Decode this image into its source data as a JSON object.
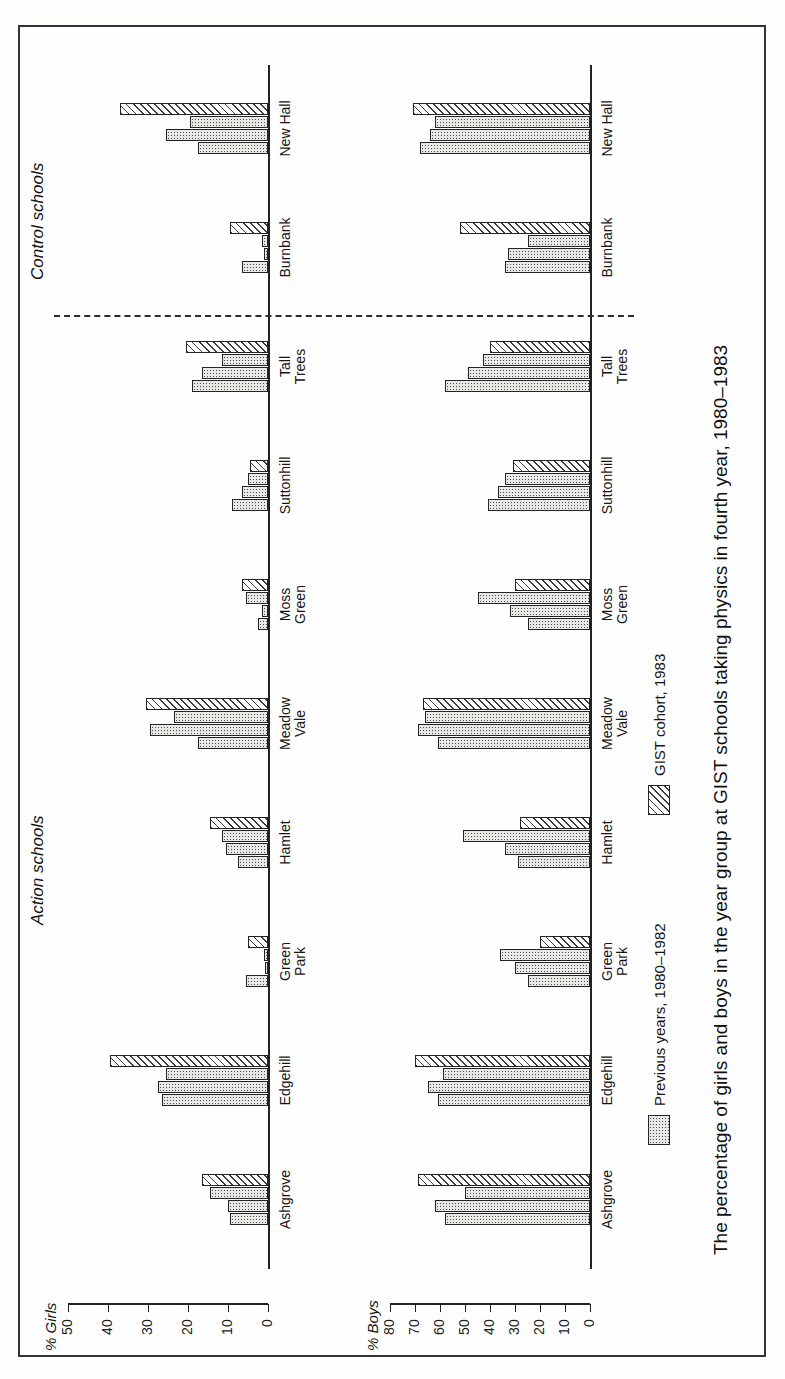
{
  "figure": {
    "caption": "The percentage of girls and boys in the year group at GIST schools taking physics in fourth year, 1980–1983",
    "section_headers": {
      "action": "Action schools",
      "control": "Control schools"
    },
    "legend": [
      {
        "label": "Previous years, 1980–1982",
        "pattern": "dotted"
      },
      {
        "label": "GIST cohort, 1983",
        "pattern": "hatched"
      }
    ]
  },
  "chart_data": [
    {
      "type": "bar",
      "orientation": "horizontal",
      "title": "",
      "ylabel": "% Girls",
      "xlabel": "",
      "ylim": [
        0,
        50
      ],
      "ticks": [
        0,
        10,
        20,
        30,
        40,
        50
      ],
      "grid": false,
      "legend_position": "below",
      "categories": [
        "Ashgrove",
        "Edgehill",
        "Green\nPark",
        "Hamlet",
        "Meadow\nVale",
        "Moss\nGreen",
        "Suttonhill",
        "Tall\nTrees",
        "Burnbank",
        "New Hall"
      ],
      "series": [
        {
          "name": "1980",
          "pattern": "dotted",
          "values": [
            9.5,
            26.5,
            5.5,
            7.5,
            17.5,
            2.5,
            9.0,
            19.0,
            6.5,
            17.5
          ]
        },
        {
          "name": "1981",
          "pattern": "dotted",
          "values": [
            10.0,
            27.5,
            0.8,
            10.5,
            29.5,
            1.5,
            6.5,
            16.5,
            1.0,
            25.5
          ]
        },
        {
          "name": "1982",
          "pattern": "dotted",
          "values": [
            14.5,
            25.5,
            1.0,
            11.5,
            23.5,
            5.5,
            5.0,
            11.5,
            1.5,
            19.5
          ]
        },
        {
          "name": "GIST cohort, 1983",
          "pattern": "hatched",
          "values": [
            16.5,
            39.5,
            5.0,
            14.5,
            30.5,
            6.5,
            4.5,
            20.5,
            9.5,
            37.0
          ]
        }
      ]
    },
    {
      "type": "bar",
      "orientation": "horizontal",
      "title": "",
      "ylabel": "% Boys",
      "xlabel": "",
      "ylim": [
        0,
        80
      ],
      "ticks": [
        0,
        10,
        20,
        30,
        40,
        50,
        60,
        70,
        80
      ],
      "grid": false,
      "legend_position": "below",
      "categories": [
        "Ashgrove",
        "Edgehill",
        "Green\nPark",
        "Hamlet",
        "Meadow\nVale",
        "Moss\nGreen",
        "Suttonhill",
        "Tall\nTrees",
        "Burnbank",
        "New Hall"
      ],
      "series": [
        {
          "name": "1980",
          "pattern": "dotted",
          "values": [
            58.0,
            61.0,
            25.0,
            29.0,
            61.0,
            25.0,
            41.0,
            58.0,
            34.0,
            68.0
          ]
        },
        {
          "name": "1981",
          "pattern": "dotted",
          "values": [
            62.0,
            65.0,
            30.0,
            34.0,
            69.0,
            32.0,
            37.0,
            49.0,
            33.0,
            64.0
          ]
        },
        {
          "name": "1982",
          "pattern": "dotted",
          "values": [
            50.0,
            59.0,
            36.0,
            51.0,
            66.0,
            45.0,
            34.0,
            43.0,
            25.0,
            62.0
          ]
        },
        {
          "name": "GIST cohort, 1983",
          "pattern": "hatched",
          "values": [
            69.0,
            70.0,
            20.0,
            28.0,
            67.0,
            30.0,
            31.0,
            40.0,
            52.0,
            71.0
          ]
        }
      ]
    }
  ]
}
